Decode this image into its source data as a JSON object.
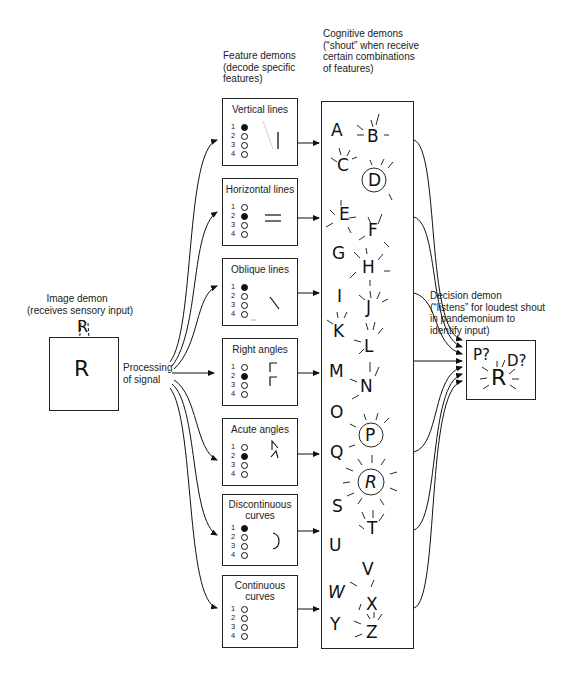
{
  "image_demon": {
    "title": "Image demon",
    "subtitle": "(receives sensory input)",
    "top_letter": "R",
    "box_letter": "R"
  },
  "processing": {
    "line1": "Processing",
    "line2": "of signal"
  },
  "feature_header": {
    "line1": "Feature demons",
    "line2": "(decode specific",
    "line3": "features)"
  },
  "cognitive_header": {
    "line1": "Cognitive demons",
    "line2": "(“shout” when receive",
    "line3": "certain combinations",
    "line4": "of features)"
  },
  "decision_header": {
    "line1": "Decision demon",
    "line2": "(“listens” for loudest shout",
    "line3": "in pandemonium to",
    "line4": "identify input)"
  },
  "decision_box": {
    "guess1": "P?",
    "guess2": "D?",
    "answer": "R"
  },
  "feature_demons": [
    {
      "title1": "Vertical lines",
      "title2": "",
      "counts": [
        "1",
        "2",
        "3",
        "4"
      ],
      "active": [
        true,
        false,
        false,
        false
      ],
      "glyph": "vertical-line"
    },
    {
      "title1": "Horizontal lines",
      "title2": "",
      "counts": [
        "1",
        "2",
        "3",
        "4"
      ],
      "active": [
        false,
        true,
        false,
        false
      ],
      "glyph": "horizontal-lines"
    },
    {
      "title1": "Oblique lines",
      "title2": "",
      "counts": [
        "1",
        "2",
        "3",
        "4"
      ],
      "active": [
        true,
        false,
        false,
        false
      ],
      "glyph": "oblique-line"
    },
    {
      "title1": "Right angles",
      "title2": "",
      "counts": [
        "1",
        "2",
        "3",
        "4"
      ],
      "active": [
        false,
        true,
        false,
        false
      ],
      "glyph": "right-angles"
    },
    {
      "title1": "Acute angles",
      "title2": "",
      "counts": [
        "1",
        "2",
        "3",
        "4"
      ],
      "active": [
        false,
        true,
        false,
        false
      ],
      "glyph": "acute-angles"
    },
    {
      "title1": "Discontinuous",
      "title2": "curves",
      "counts": [
        "1",
        "2",
        "3",
        "4"
      ],
      "active": [
        true,
        false,
        false,
        false
      ],
      "glyph": "curve"
    },
    {
      "title1": "Continuous",
      "title2": "curves",
      "counts": [
        "1",
        "2",
        "3",
        "4"
      ],
      "active": [
        false,
        false,
        false,
        false
      ],
      "glyph": "none"
    }
  ],
  "cognitive_demons": {
    "letters": [
      "A",
      "B",
      "C",
      "D",
      "E",
      "F",
      "G",
      "H",
      "I",
      "J",
      "K",
      "L",
      "M",
      "N",
      "O",
      "P",
      "Q",
      "R",
      "S",
      "T",
      "U",
      "V",
      "W",
      "X",
      "Y",
      "Z"
    ],
    "circled": [
      "D",
      "P",
      "R"
    ]
  }
}
